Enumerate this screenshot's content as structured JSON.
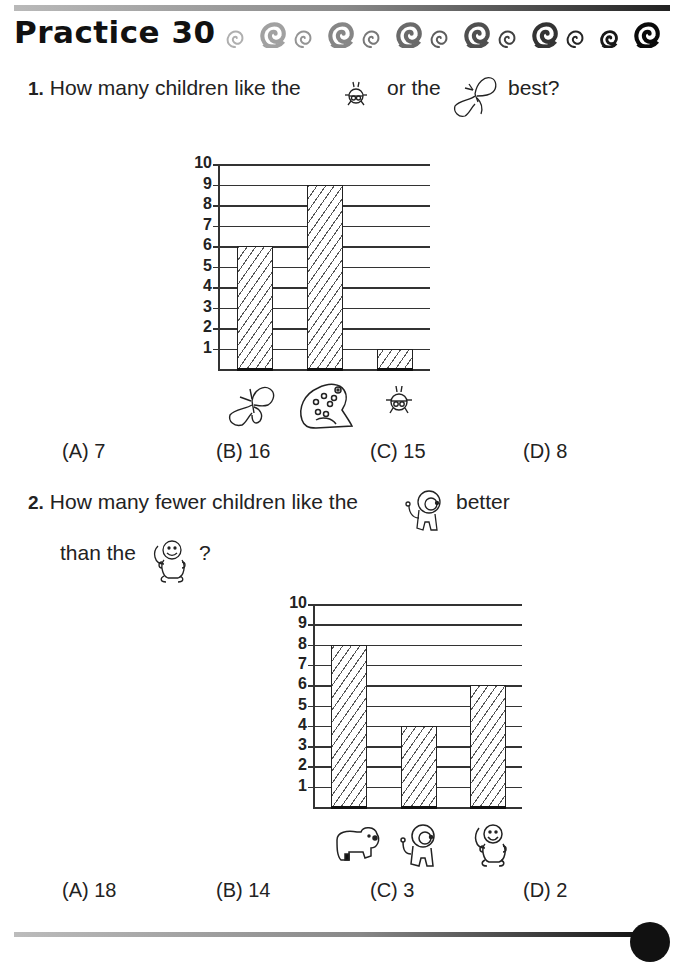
{
  "header": {
    "title": "Practice 30",
    "decoration_count": 13
  },
  "question1": {
    "number": "1.",
    "text_before": "How many children like the",
    "icon1": "ladybug-icon",
    "text_middle": "or the",
    "icon2": "butterfly-icon",
    "text_after": "best?",
    "choices": [
      {
        "label": "(A) 7"
      },
      {
        "label": "(B) 16"
      },
      {
        "label": "(C) 15"
      },
      {
        "label": "(D) 8"
      }
    ]
  },
  "question2": {
    "number": "2.",
    "line1_before": "How many fewer children like the",
    "icon1": "lion-icon",
    "line1_after": "better",
    "line2_before": "than the",
    "icon2": "monkey-icon",
    "line2_after": "?",
    "choices": [
      {
        "label": "(A) 18"
      },
      {
        "label": "(B) 14"
      },
      {
        "label": "(C) 3"
      },
      {
        "label": "(D) 2"
      }
    ]
  },
  "chart_data": [
    {
      "type": "bar",
      "title": "",
      "categories": [
        "butterfly",
        "frog",
        "ladybug"
      ],
      "values": [
        6,
        9,
        1
      ],
      "xlabel": "",
      "ylabel": "",
      "ylim": [
        0,
        10
      ],
      "yticks": [
        "1",
        "2",
        "3",
        "4",
        "5",
        "6",
        "7",
        "8",
        "9",
        "10"
      ],
      "grid": true,
      "bar_fill": "diagonal-hatch"
    },
    {
      "type": "bar",
      "title": "",
      "categories": [
        "bear",
        "lion",
        "monkey"
      ],
      "values": [
        8,
        4,
        6
      ],
      "xlabel": "",
      "ylabel": "",
      "ylim": [
        0,
        10
      ],
      "yticks": [
        "1",
        "2",
        "3",
        "4",
        "5",
        "6",
        "7",
        "8",
        "9",
        "10"
      ],
      "grid": true,
      "bar_fill": "diagonal-hatch"
    }
  ]
}
